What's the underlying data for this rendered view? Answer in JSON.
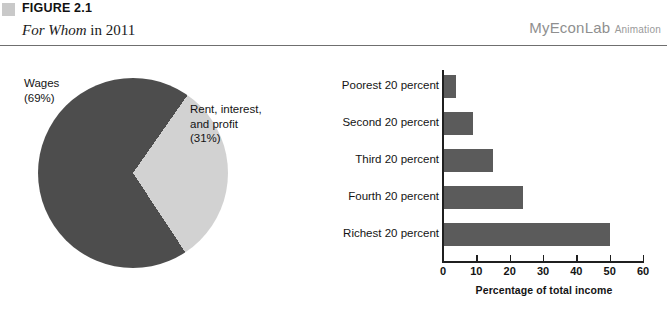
{
  "header": {
    "marker_icon": "gray-square-icon",
    "figure_number": "FIGURE 2.1",
    "subtitle_italic": "For Whom",
    "subtitle_roman": " in 2011",
    "brand_name": "MyEconLab",
    "brand_sub": "Animation"
  },
  "colors": {
    "pie_dark": "#4d4d4d",
    "pie_light": "#d2d2d2",
    "bar_fill": "#5b5b5b",
    "axis": "#1f1f1f",
    "rule": "#6f6f6f",
    "marker": "#c9c9c9",
    "brand_text": "#8f8f8f"
  },
  "chart_data": [
    {
      "type": "pie",
      "title": "For Whom in 2011",
      "labels": [
        "Wages",
        "Rent, interest, and profit"
      ],
      "values": [
        69,
        31
      ],
      "value_unit": "percent",
      "slice_colors": [
        "#4d4d4d",
        "#d2d2d2"
      ],
      "annotations": [
        {
          "name": "wages-label",
          "line1": "Wages",
          "line2": "(69%)"
        },
        {
          "name": "rent-label",
          "line1": "Rent, interest,",
          "line2": "and profit",
          "line3": "(31%)"
        }
      ],
      "legend": "none"
    },
    {
      "type": "bar",
      "orientation": "horizontal",
      "categories": [
        "Poorest 20 percent",
        "Second 20 percent",
        "Third 20 percent",
        "Fourth 20 percent",
        "Richest 20 percent"
      ],
      "values": [
        4,
        9,
        15,
        24,
        50
      ],
      "title": "",
      "xlabel": "Percentage of total income",
      "ylabel": "",
      "xlim": [
        0,
        60
      ],
      "xticks": [
        0,
        10,
        20,
        30,
        40,
        50,
        60
      ],
      "xtick_labels": [
        "0",
        "10",
        "20",
        "30",
        "40",
        "50",
        "60"
      ],
      "grid": false,
      "legend": "none",
      "bar_color": "#5b5b5b"
    }
  ]
}
